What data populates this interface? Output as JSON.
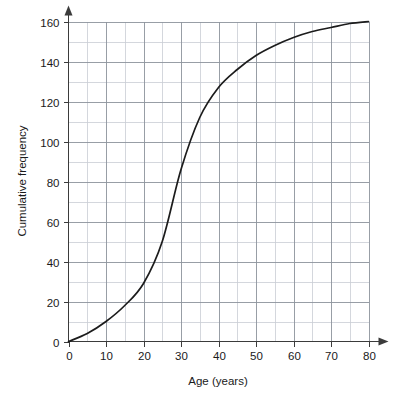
{
  "chart_data": {
    "type": "line",
    "title": "",
    "subtitle": "",
    "xlabel": "Age (years)",
    "ylabel": "Cumulative frequency",
    "xlim": [
      0,
      80
    ],
    "ylim": [
      0,
      160
    ],
    "x_major_step": 10,
    "x_minor_step": 5,
    "y_major_step": 20,
    "y_minor_step": 10,
    "grid": true,
    "legend": false,
    "legend_position": "none",
    "x_tick_labels": [
      "0",
      "10",
      "20",
      "30",
      "40",
      "50",
      "60",
      "70",
      "80"
    ],
    "y_tick_labels": [
      "0",
      "20",
      "40",
      "60",
      "80",
      "100",
      "120",
      "140",
      "160"
    ],
    "series": [
      {
        "name": "Cumulative frequency",
        "color": "#1c1c1c",
        "x": [
          0,
          5,
          10,
          15,
          20,
          25,
          30,
          35,
          40,
          45,
          50,
          55,
          60,
          65,
          70,
          75,
          80
        ],
        "values": [
          0,
          4,
          10,
          18,
          29,
          50,
          86,
          112,
          127,
          136,
          143,
          148,
          152,
          155,
          157,
          159,
          160
        ]
      }
    ],
    "annotations": []
  },
  "axes": {
    "x_axis_name": "age-axis",
    "y_axis_name": "cumulative-frequency-axis",
    "x_arrow": true,
    "y_arrow": true
  },
  "colors": {
    "curve": "#1c1c1c",
    "grid_major": "#8d939c",
    "grid_minor": "#c9cdd4",
    "axis": "#3b3b3b",
    "background": "#ffffff",
    "text": "#1a1a1a"
  }
}
